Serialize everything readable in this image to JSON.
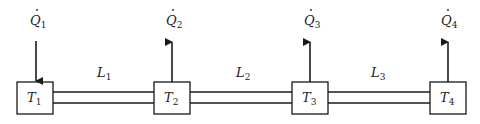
{
  "diagram": {
    "type": "heat-transfer pipeline schematic",
    "nodes": [
      {
        "id": "T1",
        "label": "T",
        "sub": "1",
        "heat_label": "Q",
        "heat_sub": "1",
        "heat_direction": "in",
        "x": 17,
        "w": 36
      },
      {
        "id": "T2",
        "label": "T",
        "sub": "2",
        "heat_label": "Q",
        "heat_sub": "2",
        "heat_direction": "out",
        "x": 154,
        "w": 36
      },
      {
        "id": "T3",
        "label": "T",
        "sub": "3",
        "heat_label": "Q",
        "heat_sub": "3",
        "heat_direction": "out",
        "x": 292,
        "w": 36
      },
      {
        "id": "T4",
        "label": "T",
        "sub": "4",
        "heat_label": "Q",
        "heat_sub": "4",
        "heat_direction": "out",
        "x": 430,
        "w": 36
      }
    ],
    "segments": [
      {
        "id": "L1",
        "label": "L",
        "sub": "1",
        "from": "T1",
        "to": "T2"
      },
      {
        "id": "L2",
        "label": "L",
        "sub": "2",
        "from": "T2",
        "to": "T3"
      },
      {
        "id": "L3",
        "label": "L",
        "sub": "3",
        "from": "T3",
        "to": "T4"
      }
    ],
    "colors": {
      "stroke": "#1a1a1a",
      "background": "#ffffff"
    }
  }
}
